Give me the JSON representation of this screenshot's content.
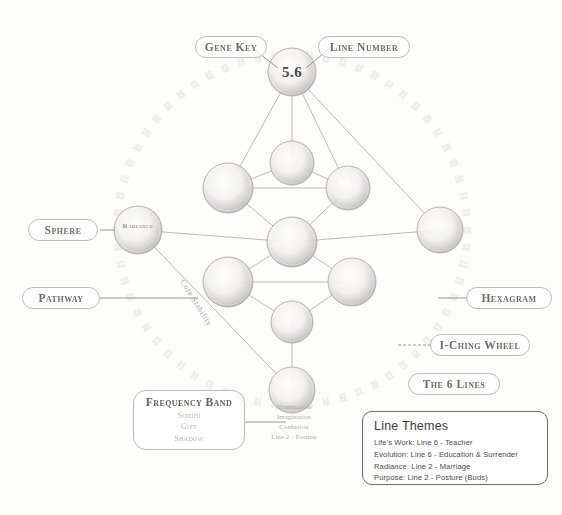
{
  "diagram": {
    "key_number": "5.6",
    "ink_color": "#8a8784",
    "paper_color": "#fdfdfc"
  },
  "callouts": [
    {
      "id": "gene-key",
      "label": "Gene Key"
    },
    {
      "id": "line-number",
      "label": "Line Number"
    },
    {
      "id": "sphere",
      "label": "Sphere"
    },
    {
      "id": "pathway",
      "label": "Pathway"
    },
    {
      "id": "hexagram",
      "label": "Hexagram"
    },
    {
      "id": "iching-wheel",
      "label": "I-Ching Wheel"
    },
    {
      "id": "the-6-lines",
      "label": "The 6 Lines"
    }
  ],
  "frequency_band": {
    "title": "Frequency Band",
    "bands": [
      "Siddhi",
      "Gift",
      "Shadow"
    ]
  },
  "line_themes": {
    "title": "Line Themes",
    "rows": [
      "Life's Work: Line 6 - Teacher",
      "Evolution: Line 6 - Education & Surrender",
      "Radiance: Line 2 - Marriage",
      "Purpose: Line 2 - Posture (Buds)"
    ]
  },
  "centre_annotation": {
    "lines": [
      "Illumination",
      "Imagination",
      "Confusion",
      "Line 2 - Posture"
    ]
  },
  "sphere_labels": {
    "radiance": "Radiance"
  },
  "pathway_label": "Core Stability",
  "spheres": [
    {
      "id": "top-crown",
      "name": "gene-key-sphere",
      "cx": 292,
      "cy": 72,
      "r": 24
    },
    {
      "id": "upper-mid",
      "name": "sphere-upper-mid",
      "cx": 292,
      "cy": 163,
      "r": 22
    },
    {
      "id": "upper-left",
      "name": "sphere-upper-left",
      "cx": 228,
      "cy": 188,
      "r": 25
    },
    {
      "id": "upper-right",
      "name": "sphere-upper-right",
      "cx": 348,
      "cy": 188,
      "r": 22
    },
    {
      "id": "centre",
      "name": "sphere-centre",
      "cx": 292,
      "cy": 242,
      "r": 25
    },
    {
      "id": "lower-left",
      "name": "sphere-lower-left",
      "cx": 228,
      "cy": 282,
      "r": 25
    },
    {
      "id": "lower-right",
      "name": "sphere-lower-right",
      "cx": 352,
      "cy": 282,
      "r": 24
    },
    {
      "id": "lower-mid",
      "name": "sphere-lower-mid",
      "cx": 292,
      "cy": 322,
      "r": 21
    },
    {
      "id": "bottom",
      "name": "sphere-bottom",
      "cx": 292,
      "cy": 390,
      "r": 23
    },
    {
      "id": "left-radiance",
      "name": "sphere-radiance",
      "cx": 138,
      "cy": 230,
      "r": 24
    },
    {
      "id": "right-purpose",
      "name": "sphere-right",
      "cx": 440,
      "cy": 230,
      "r": 23
    }
  ],
  "wheel": {
    "cx": 292,
    "cy": 230,
    "radius": 175,
    "glyph_count": 64
  }
}
